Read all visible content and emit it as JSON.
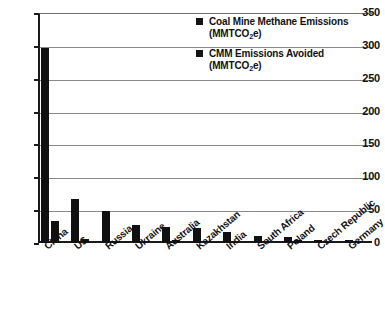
{
  "chart_data": {
    "type": "bar",
    "title": "",
    "xlabel": "",
    "ylabel": "",
    "ylim": [
      0,
      350
    ],
    "ytick_step": 50,
    "yticks": [
      "0",
      "50",
      "100",
      "150",
      "200",
      "250",
      "300",
      "350"
    ],
    "grid": true,
    "legend_position": "top-right",
    "categories": [
      "China",
      "US",
      "Russia",
      "Ukraine",
      "Australia",
      "Kazakhstan",
      "India",
      "South Africa",
      "Poland",
      "Czech Republic",
      "Germany"
    ],
    "series": [
      {
        "name": "Coal Mine Methane Emissions (MMTCO2e)",
        "values": [
          297,
          67,
          48,
          27,
          24,
          23,
          17,
          11,
          9,
          4,
          4
        ]
      },
      {
        "name": "CMM Emissions Avoided (MMTCO2e)",
        "values": [
          33,
          6,
          2,
          0,
          4,
          0,
          0,
          0,
          5,
          1,
          3
        ]
      }
    ]
  },
  "legend": {
    "entries": [
      {
        "label_line1": "Coal Mine Methane Emissions",
        "label_line2_prefix": "(MMTCO",
        "label_line2_sub": "2",
        "label_line2_suffix": "e)"
      },
      {
        "label_line1": "CMM Emissions Avoided",
        "label_line2_prefix": "(MMTCO",
        "label_line2_sub": "2",
        "label_line2_suffix": "e)"
      }
    ]
  }
}
